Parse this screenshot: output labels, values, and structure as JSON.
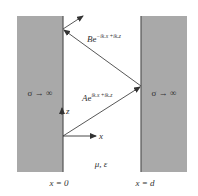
{
  "diagram": {
    "left_conductor": {
      "label": "σ → ∞",
      "boundary_label": "x = 0"
    },
    "right_conductor": {
      "label": "σ → ∞",
      "boundary_label": "x = d"
    },
    "medium_label": "μ, ε",
    "incident_wave": {
      "coef": "A",
      "base": "e",
      "exponent": "ikₓx +ikᵤz"
    },
    "reflected_wave": {
      "coef": "B",
      "base": "e",
      "exponent": "−ikₓx +ikᵤz"
    },
    "axes": {
      "x_label": "x",
      "z_label": "z"
    },
    "colors": {
      "conductor_fill": "#a9a9a9",
      "conductor_edge": "#555555",
      "line": "#333333",
      "background": "#ffffff"
    }
  }
}
